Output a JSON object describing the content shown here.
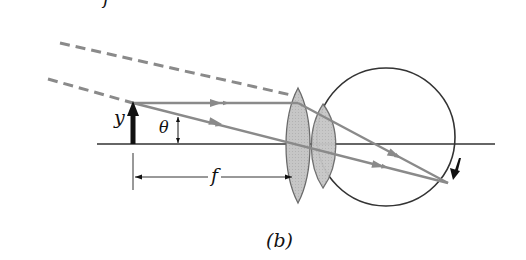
{
  "figure": {
    "panel_label": "(b)",
    "top_fragment_label": "f",
    "labels": {
      "object_height": "y",
      "angle": "θ",
      "focal_length": "f"
    },
    "colors": {
      "ray": "#8a8a8a",
      "axis": "#333333",
      "lens_fill": "#c4c4c4",
      "lens_stroke": "#6a6a6a",
      "eye_outline": "#333333",
      "object_arrow": "#111111"
    },
    "elements": {
      "optical_axis": "horizontal optical axis",
      "object": "upright object arrow of height y at focal point",
      "magnifier_lens": "converging lens at distance f from object",
      "eye_lens": "lens of the eye",
      "eye": "eyeball circle",
      "retina_image": "inverted image on retina",
      "dashed_rays": "dashed extensions of parallel rays",
      "angle_marker": "angle θ subtended at lens",
      "focal_dimension": "dimension line marking distance f"
    }
  }
}
